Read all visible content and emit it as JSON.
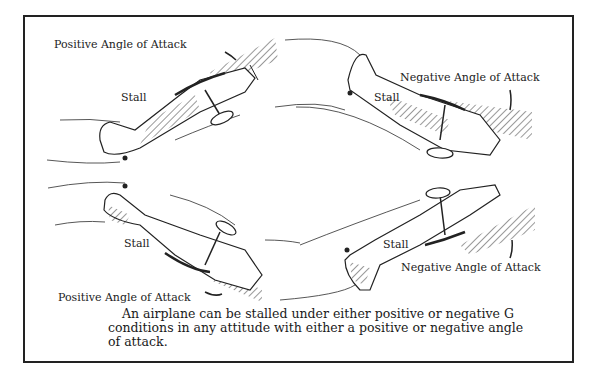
{
  "figure": {
    "labels": {
      "top_left_angle": "Positive Angle of Attack",
      "top_left_stall": "Stall",
      "top_right_angle": "Negative Angle of Attack",
      "top_right_stall": "Stall",
      "bottom_left_stall": "Stall",
      "bottom_left_angle": "Positive Angle of Attack",
      "bottom_right_stall": "Stall",
      "bottom_right_angle": "Negative Angle of Attack"
    },
    "caption": {
      "line1": "An airplane can be stalled under either positive or negative G",
      "line2": "conditions in any attitude with either a positive or negative angle",
      "line3": "of attack."
    },
    "icons": [
      "airplane-nose-up",
      "airplane-inverted-descending",
      "airplane-inverted-nose-down",
      "airplane-climbing-right",
      "hatched-wedge",
      "curved-arrow"
    ]
  }
}
